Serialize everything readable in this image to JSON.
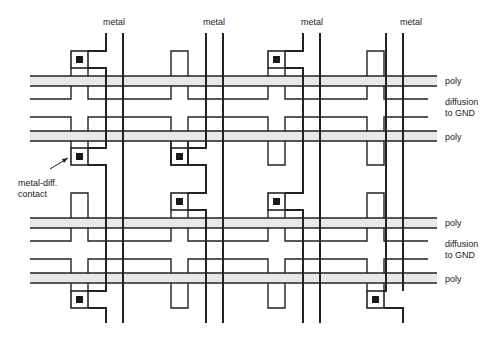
{
  "diagram": {
    "type": "layout",
    "metal_labels": [
      "metal",
      "metal",
      "metal",
      "metal"
    ],
    "right_labels": {
      "poly_1": "poly",
      "diffusion_1_line1": "diffusion",
      "diffusion_1_line2": "to GND",
      "poly_2": "poly",
      "poly_3": "poly",
      "diffusion_2_line1": "diffusion",
      "diffusion_2_line2": "to GND",
      "poly_4": "poly"
    },
    "annotation": {
      "line1": "metal-diff.",
      "line2": "contact"
    },
    "colors": {
      "line": "#222222",
      "poly_fill": "#e8e8e8",
      "contact": "#1a1a1a",
      "background": "#ffffff"
    }
  }
}
